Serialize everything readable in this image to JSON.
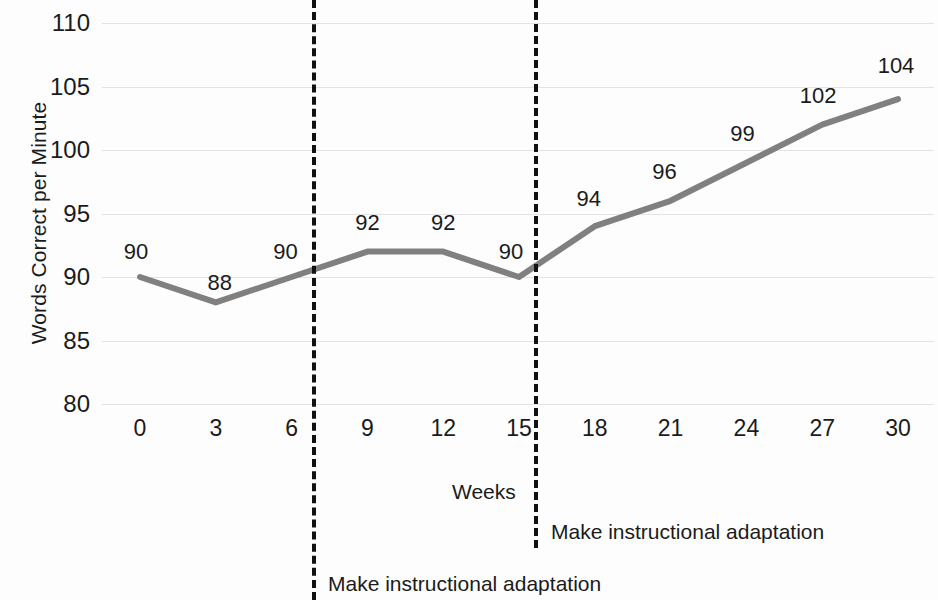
{
  "chart_data": {
    "type": "line",
    "title": "",
    "xlabel": "Weeks",
    "ylabel": "Words Correct per Minute",
    "x": [
      0,
      3,
      6,
      9,
      12,
      15,
      18,
      21,
      24,
      27,
      30
    ],
    "values": [
      90,
      88,
      90,
      92,
      92,
      90,
      94,
      96,
      99,
      102,
      104
    ],
    "point_labels": [
      "90",
      "88",
      "90",
      "92",
      "92",
      "90",
      "94",
      "96",
      "99",
      "102",
      "104"
    ],
    "series": [
      {
        "name": "Words Correct per Minute",
        "values": [
          90,
          88,
          90,
          92,
          92,
          90,
          94,
          96,
          99,
          102,
          104
        ],
        "color": "#808080"
      }
    ],
    "xlim": [
      0,
      30
    ],
    "ylim": [
      80,
      110
    ],
    "x_tick_labels": [
      "0",
      "3",
      "6",
      "9",
      "12",
      "15",
      "18",
      "21",
      "24",
      "27",
      "30"
    ],
    "y_tick_labels": [
      "80",
      "85",
      "90",
      "95",
      "100",
      "105",
      "110"
    ],
    "y_ticks": [
      80,
      85,
      90,
      95,
      100,
      105,
      110
    ],
    "grid": "horizontal",
    "grid_color": "#e3e3e3",
    "legend": "none",
    "phase_lines": [
      {
        "x": 6.8,
        "label": "Make instructional adaptation",
        "style": "dashed",
        "color": "#111111"
      },
      {
        "x": 15.6,
        "label": "Make instructional adaptation",
        "style": "dashed",
        "color": "#111111"
      }
    ],
    "annotations": [
      {
        "text": "Make instructional adaptation",
        "near": "second-phase-line"
      },
      {
        "text": "Make instructional adaptation",
        "near": "first-phase-line"
      }
    ],
    "background_color": "#ffffff",
    "line_color": "#808080",
    "text_color": "#1b1b1b"
  }
}
